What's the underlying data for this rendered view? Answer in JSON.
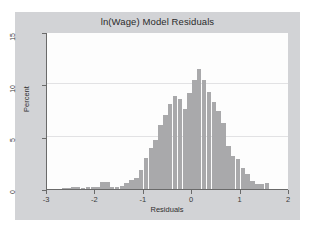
{
  "chart_data": {
    "type": "bar",
    "title": "ln(Wage) Model Residuals",
    "xlabel": "Residuals",
    "ylabel": "Percent",
    "xlim": [
      -3,
      2
    ],
    "ylim": [
      0,
      15
    ],
    "xticks": [
      -3,
      -2,
      -1,
      0,
      1,
      2
    ],
    "xtick_labels": [
      "-3",
      "-2",
      "-1",
      "0",
      "1",
      "2"
    ],
    "yticks": [
      0,
      5,
      10,
      15
    ],
    "ytick_labels": [
      "0",
      "5",
      "10",
      "15"
    ],
    "grid": "horizontal",
    "legend": null,
    "bin_width": 0.1,
    "bar_color": "#a9a9ab",
    "plot_background": "#fdfdfd",
    "graph_background": "#d2d3d6",
    "categories": [
      -2.65,
      -2.55,
      -2.45,
      -2.35,
      -2.25,
      -2.15,
      -2.05,
      -1.95,
      -1.85,
      -1.75,
      -1.65,
      -1.55,
      -1.45,
      -1.35,
      -1.25,
      -1.15,
      -1.05,
      -0.95,
      -0.85,
      -0.75,
      -0.65,
      -0.55,
      -0.45,
      -0.35,
      -0.25,
      -0.15,
      -0.05,
      0.05,
      0.15,
      0.25,
      0.35,
      0.45,
      0.55,
      0.65,
      0.75,
      0.85,
      0.95,
      1.05,
      1.15,
      1.25,
      1.35,
      1.45,
      1.55
    ],
    "values": [
      0.12,
      0.1,
      0.18,
      0.15,
      0.12,
      0.2,
      0.18,
      0.22,
      0.7,
      0.65,
      0.2,
      0.18,
      0.3,
      0.55,
      0.85,
      1.1,
      1.85,
      3.0,
      3.9,
      4.7,
      6.1,
      7.1,
      8.1,
      8.85,
      8.6,
      7.65,
      9.2,
      10.45,
      11.5,
      10.4,
      9.3,
      8.3,
      7.5,
      6.3,
      4.1,
      3.2,
      2.9,
      2.0,
      1.4,
      0.75,
      0.5,
      0.45,
      0.55
    ]
  }
}
